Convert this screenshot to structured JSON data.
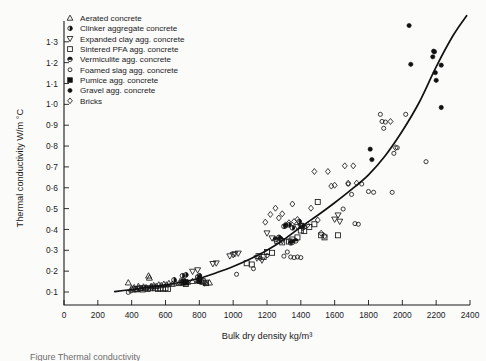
{
  "chart_data": {
    "type": "scatter",
    "title": "",
    "xlabel": "Bulk dry density kg/m³",
    "ylabel": "Thermal conductivity W/m °C",
    "xlim": [
      0,
      2400
    ],
    "ylim": [
      0,
      1.4
    ],
    "xticks": [
      0,
      200,
      400,
      600,
      800,
      1000,
      1200,
      1400,
      1600,
      1800,
      2000,
      2200,
      2400
    ],
    "xticklabels": [
      "0",
      "200",
      "400",
      "600",
      "800",
      "1000",
      "1200",
      "1400",
      "1600",
      "1800",
      "2000",
      "2200",
      "2400"
    ],
    "yticks": [
      0.1,
      0.2,
      0.3,
      0.4,
      0.5,
      0.6,
      0.7,
      0.8,
      0.9,
      1.0,
      1.1,
      1.2,
      1.3
    ],
    "yticklabels": [
      "0·1",
      "0·2",
      "0·3",
      "0·4",
      "0·5",
      "0·6",
      "0·7",
      "0·8",
      "0·9",
      "1·0",
      "1·1",
      "1·2",
      "1·3"
    ],
    "grid": false,
    "legend_position": "upper-left",
    "series": [
      {
        "name": "Aerated concrete",
        "marker": "triangle-up-open",
        "points": [
          [
            380,
            0.145
          ],
          [
            400,
            0.118
          ],
          [
            415,
            0.122
          ],
          [
            430,
            0.112
          ],
          [
            440,
            0.128
          ],
          [
            455,
            0.118
          ],
          [
            470,
            0.125
          ],
          [
            485,
            0.122
          ],
          [
            500,
            0.178
          ],
          [
            505,
            0.168
          ],
          [
            515,
            0.128
          ],
          [
            530,
            0.132
          ],
          [
            545,
            0.128
          ],
          [
            560,
            0.135
          ],
          [
            575,
            0.132
          ],
          [
            590,
            0.138
          ],
          [
            605,
            0.135
          ],
          [
            620,
            0.142
          ],
          [
            640,
            0.138
          ],
          [
            660,
            0.145
          ],
          [
            680,
            0.142
          ],
          [
            700,
            0.148
          ],
          [
            715,
            0.152
          ],
          [
            730,
            0.148
          ],
          [
            760,
            0.152
          ],
          [
            790,
            0.155
          ],
          [
            820,
            0.148
          ],
          [
            840,
            0.142
          ],
          [
            860,
            0.145
          ]
        ]
      },
      {
        "name": "Clinker aggregate concrete",
        "marker": "circle-dot",
        "points": [
          [
            650,
            0.158
          ],
          [
            700,
            0.178
          ],
          [
            720,
            0.182
          ],
          [
            790,
            0.172
          ],
          [
            800,
            0.178
          ],
          [
            1270,
            0.362
          ],
          [
            1300,
            0.415
          ],
          [
            1330,
            0.422
          ],
          [
            1350,
            0.408
          ],
          [
            1390,
            0.438
          ],
          [
            1410,
            0.418
          ]
        ]
      },
      {
        "name": "Expanded clay agg. concrete",
        "marker": "triangle-down-open",
        "points": [
          [
            700,
            0.152
          ],
          [
            760,
            0.198
          ],
          [
            790,
            0.205
          ],
          [
            830,
            0.142
          ],
          [
            880,
            0.235
          ],
          [
            900,
            0.238
          ],
          [
            980,
            0.272
          ],
          [
            1000,
            0.278
          ],
          [
            1010,
            0.282
          ],
          [
            1030,
            0.285
          ],
          [
            1140,
            0.262
          ],
          [
            1170,
            0.252
          ],
          [
            1200,
            0.382
          ],
          [
            1230,
            0.358
          ],
          [
            1260,
            0.352
          ],
          [
            1290,
            0.345
          ],
          [
            1340,
            0.342
          ],
          [
            1380,
            0.412
          ],
          [
            1400,
            0.418
          ],
          [
            1410,
            0.408
          ],
          [
            1600,
            0.448
          ],
          [
            1620,
            0.468
          ],
          [
            1630,
            0.438
          ]
        ]
      },
      {
        "name": "Sintered PFA agg. concrete",
        "marker": "square-open",
        "points": [
          [
            410,
            0.112
          ],
          [
            430,
            0.115
          ],
          [
            450,
            0.118
          ],
          [
            465,
            0.112
          ],
          [
            480,
            0.118
          ],
          [
            495,
            0.115
          ],
          [
            510,
            0.118
          ],
          [
            525,
            0.122
          ],
          [
            540,
            0.118
          ],
          [
            555,
            0.115
          ],
          [
            570,
            0.118
          ],
          [
            585,
            0.115
          ],
          [
            600,
            0.118
          ],
          [
            615,
            0.115
          ],
          [
            700,
            0.145
          ],
          [
            720,
            0.138
          ],
          [
            800,
            0.158
          ],
          [
            820,
            0.152
          ],
          [
            840,
            0.145
          ],
          [
            1080,
            0.238
          ],
          [
            1110,
            0.232
          ],
          [
            1150,
            0.272
          ],
          [
            1180,
            0.268
          ],
          [
            1200,
            0.292
          ],
          [
            1230,
            0.288
          ],
          [
            1260,
            0.345
          ],
          [
            1290,
            0.338
          ],
          [
            1330,
            0.342
          ],
          [
            1350,
            0.352
          ],
          [
            1380,
            0.362
          ],
          [
            1400,
            0.395
          ],
          [
            1420,
            0.392
          ],
          [
            1450,
            0.412
          ],
          [
            1480,
            0.425
          ],
          [
            1500,
            0.532
          ],
          [
            1520,
            0.372
          ],
          [
            1540,
            0.362
          ],
          [
            1620,
            0.372
          ]
        ]
      },
      {
        "name": "Vermiculite agg. concrete",
        "marker": "circle-half",
        "points": [
          [
            1250,
            0.352
          ],
          [
            1280,
            0.355
          ],
          [
            1310,
            0.418
          ],
          [
            1340,
            0.335
          ],
          [
            1350,
            0.338
          ],
          [
            1370,
            0.345
          ]
        ]
      },
      {
        "name": "Foamed slag agg. concrete",
        "marker": "circle-small-open",
        "points": [
          [
            380,
            0.098
          ],
          [
            395,
            0.105
          ],
          [
            1020,
            0.185
          ],
          [
            1120,
            0.212
          ],
          [
            1160,
            0.262
          ],
          [
            1200,
            0.275
          ],
          [
            1300,
            0.272
          ],
          [
            1320,
            0.292
          ],
          [
            1340,
            0.268
          ],
          [
            1360,
            0.265
          ],
          [
            1380,
            0.268
          ],
          [
            1400,
            0.265
          ],
          [
            1650,
            0.498
          ],
          [
            1680,
            0.618
          ],
          [
            1700,
            0.568
          ],
          [
            1720,
            0.428
          ],
          [
            1740,
            0.425
          ],
          [
            1760,
            0.618
          ],
          [
            1800,
            0.582
          ],
          [
            1830,
            0.578
          ],
          [
            1870,
            0.952
          ],
          [
            1880,
            0.918
          ],
          [
            1890,
            0.885
          ],
          [
            1900,
            0.915
          ],
          [
            1940,
            0.578
          ],
          [
            1950,
            0.765
          ],
          [
            1970,
            0.792
          ],
          [
            2020,
            0.952
          ],
          [
            2140,
            0.725
          ]
        ]
      },
      {
        "name": "Pumice agg. concrete",
        "marker": "square-filled",
        "points": [
          [
            710,
            0.148
          ],
          [
            720,
            0.145
          ],
          [
            800,
            0.152
          ]
        ]
      },
      {
        "name": "Gravel agg. concrete",
        "marker": "circle-filled",
        "points": [
          [
            1810,
            0.785
          ],
          [
            1820,
            0.735
          ],
          [
            2040,
            1.378
          ],
          [
            2050,
            1.192
          ],
          [
            2180,
            1.228
          ],
          [
            2185,
            1.255
          ],
          [
            2190,
            1.252
          ],
          [
            2195,
            1.152
          ],
          [
            2200,
            1.115
          ],
          [
            2230,
            1.188
          ],
          [
            2230,
            0.985
          ]
        ]
      },
      {
        "name": "Bricks",
        "marker": "diamond-open",
        "points": [
          [
            1190,
            0.435
          ],
          [
            1220,
            0.472
          ],
          [
            1250,
            0.502
          ],
          [
            1270,
            0.455
          ],
          [
            1290,
            0.475
          ],
          [
            1310,
            0.422
          ],
          [
            1330,
            0.432
          ],
          [
            1350,
            0.522
          ],
          [
            1360,
            0.438
          ],
          [
            1380,
            0.448
          ],
          [
            1400,
            0.418
          ],
          [
            1420,
            0.412
          ],
          [
            1440,
            0.422
          ],
          [
            1460,
            0.502
          ],
          [
            1480,
            0.678
          ],
          [
            1500,
            0.445
          ],
          [
            1520,
            0.382
          ],
          [
            1540,
            0.368
          ],
          [
            1560,
            0.678
          ],
          [
            1580,
            0.608
          ],
          [
            1600,
            0.612
          ],
          [
            1660,
            0.705
          ],
          [
            1680,
            0.622
          ],
          [
            1710,
            0.705
          ],
          [
            1730,
            0.622
          ],
          [
            1930,
            0.918
          ],
          [
            1960,
            0.792
          ]
        ]
      }
    ],
    "trend_curve": {
      "description": "Best-fit exponential trend line through all data",
      "points": [
        [
          300,
          0.102
        ],
        [
          400,
          0.112
        ],
        [
          500,
          0.122
        ],
        [
          600,
          0.134
        ],
        [
          700,
          0.148
        ],
        [
          800,
          0.166
        ],
        [
          900,
          0.192
        ],
        [
          1000,
          0.222
        ],
        [
          1100,
          0.258
        ],
        [
          1200,
          0.3
        ],
        [
          1300,
          0.352
        ],
        [
          1400,
          0.412
        ],
        [
          1500,
          0.468
        ],
        [
          1600,
          0.528
        ],
        [
          1700,
          0.592
        ],
        [
          1800,
          0.662
        ],
        [
          1900,
          0.755
        ],
        [
          2000,
          0.872
        ],
        [
          2100,
          1.01
        ],
        [
          2200,
          1.18
        ],
        [
          2300,
          1.33
        ],
        [
          2380,
          1.425
        ]
      ]
    }
  },
  "legend": {
    "items": [
      {
        "label": "Aerated concrete",
        "marker": "triangle-up-open"
      },
      {
        "label": "Clinker aggregate concrete",
        "marker": "circle-dot"
      },
      {
        "label": "Expanded clay agg. concrete",
        "marker": "triangle-down-open"
      },
      {
        "label": "Sintered PFA agg. concrete",
        "marker": "square-open"
      },
      {
        "label": "Vermiculite agg. concrete",
        "marker": "circle-half"
      },
      {
        "label": "Foamed slag agg. concrete",
        "marker": "circle-small-open"
      },
      {
        "label": "Pumice agg. concrete",
        "marker": "square-filled"
      },
      {
        "label": "Gravel agg. concrete",
        "marker": "circle-filled"
      },
      {
        "label": "Bricks",
        "marker": "diamond-open"
      }
    ]
  },
  "caption": {
    "text": "Figure   Thermal conductivity"
  },
  "colors": {
    "ink": "#1a1a1a",
    "page": "#fbfbfa",
    "curve": "#111111"
  }
}
